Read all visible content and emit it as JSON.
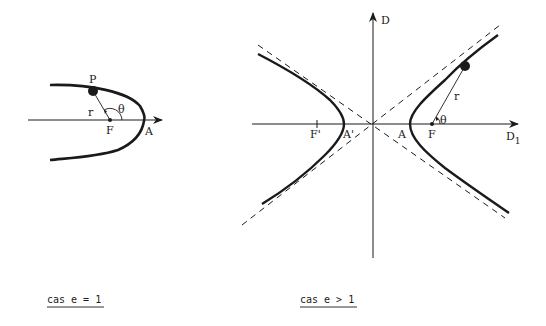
{
  "colors": {
    "ink": "#1a1a1a",
    "background": "#ffffff"
  },
  "parabola": {
    "caption": "cas e = 1",
    "labels": {
      "point": "P",
      "radius": "r",
      "angle": "θ",
      "focus": "F",
      "vertex": "A"
    }
  },
  "hyperbola": {
    "caption": "cas e > 1",
    "labels": {
      "vertical_axis": "D",
      "horizontal_axis": "D",
      "horizontal_axis_subscript": "1",
      "focus_left": "F'",
      "vertex_left": "A'",
      "vertex_right": "A",
      "focus_right": "F",
      "radius": "r",
      "angle": "θ"
    }
  }
}
